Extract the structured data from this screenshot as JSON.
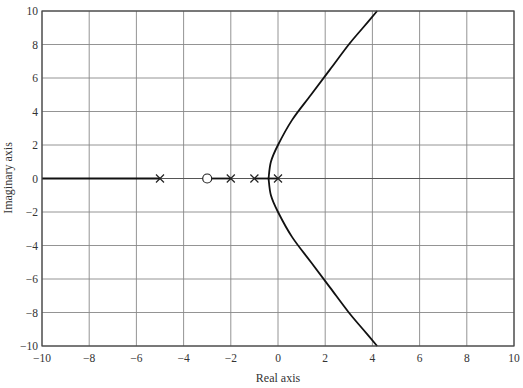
{
  "chart_data": {
    "type": "line",
    "title": "",
    "xlabel": "Real axis",
    "ylabel": "Imaginary axis",
    "xlim": [
      -10,
      10
    ],
    "ylim": [
      -10,
      10
    ],
    "grid": true,
    "x_ticks": [
      "-10",
      "-8",
      "-6",
      "-4",
      "-2",
      "0",
      "2",
      "4",
      "6",
      "8",
      "10"
    ],
    "y_ticks": [
      "10",
      "8",
      "6",
      "4",
      "2",
      "0",
      "-2",
      "-4",
      "-6",
      "-8",
      "-10"
    ],
    "poles": [
      [
        -5,
        0
      ],
      [
        -2,
        0
      ],
      [
        -1,
        0
      ],
      [
        0,
        0
      ]
    ],
    "zeros": [
      [
        -3,
        0
      ]
    ],
    "series": [
      {
        "name": "real-axis locus left",
        "x": [
          -10,
          -5
        ],
        "y": [
          0,
          0
        ]
      },
      {
        "name": "real-axis locus segment",
        "x": [
          -3,
          -2
        ],
        "y": [
          0,
          0
        ]
      },
      {
        "name": "real-axis locus segment 2",
        "x": [
          -1,
          0
        ],
        "y": [
          0,
          0
        ]
      },
      {
        "name": "upper branch",
        "x": [
          -0.4,
          -0.3,
          0,
          0.6,
          1.4,
          2.2,
          3.0,
          3.6,
          4.2
        ],
        "y": [
          0,
          1.0,
          2.0,
          3.5,
          5.0,
          6.5,
          8.0,
          9.0,
          10.0
        ]
      },
      {
        "name": "lower branch",
        "x": [
          -0.4,
          -0.3,
          0,
          0.6,
          1.4,
          2.2,
          3.0,
          3.6,
          4.2
        ],
        "y": [
          0,
          -1.0,
          -2.0,
          -3.5,
          -5.0,
          -6.5,
          -8.0,
          -9.0,
          -10.0
        ]
      }
    ]
  },
  "axes": {
    "xlabel": "Real axis",
    "ylabel": "Imaginary axis"
  }
}
